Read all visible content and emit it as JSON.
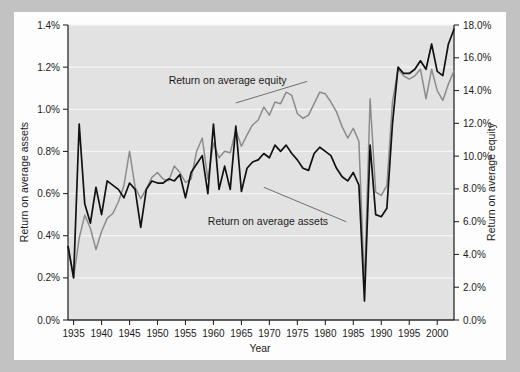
{
  "figure": {
    "background_color": "#fdfdfd",
    "plot_background_color": "#e2e2e2",
    "page_border_color": "#c2c2c2"
  },
  "chart_data": {
    "type": "line",
    "title": "",
    "subtitle": "",
    "xlabel": "Year",
    "ylabel": "Return on average assets",
    "y2label": "Return on average equity",
    "grid": true,
    "grid_color": "#f5f5f5",
    "legend_position": "inline-annotations",
    "xlim": [
      1934,
      2003
    ],
    "ylim": [
      0.0,
      1.4
    ],
    "y2lim": [
      0.0,
      18.0
    ],
    "xticks": [
      1935,
      1940,
      1945,
      1950,
      1955,
      1960,
      1965,
      1970,
      1975,
      1980,
      1985,
      1990,
      1995,
      2000
    ],
    "xtick_labels": [
      "1935",
      "1940",
      "1945",
      "1950",
      "1955",
      "1960",
      "1965",
      "1970",
      "1975",
      "1980",
      "1985",
      "1990",
      "1995",
      "2000"
    ],
    "yticks": [
      0.0,
      0.2,
      0.4,
      0.6,
      0.8,
      1.0,
      1.2,
      1.4
    ],
    "ytick_labels": [
      "0.0%",
      "0.2%",
      "0.4%",
      "0.6%",
      "0.8%",
      "1.0%",
      "1.2%",
      "1.4%"
    ],
    "y2ticks": [
      0.0,
      2.0,
      4.0,
      6.0,
      8.0,
      10.0,
      12.0,
      14.0,
      16.0,
      18.0
    ],
    "y2tick_labels": [
      "0.0%",
      "2.0%",
      "4.0%",
      "6.0%",
      "8.0%",
      "10.0%",
      "12.0%",
      "14.0%",
      "16.0%",
      "18.0%"
    ],
    "annotations": [
      {
        "text": "Return on average equity",
        "x": 1952.0,
        "y": 1.118,
        "leader_to_x": 1964.0,
        "leader_to_y": 1.03
      },
      {
        "text": "Return on average assets",
        "x": 1959.0,
        "y": 0.452,
        "leader_to_x": 1969.0,
        "leader_to_y": 0.63
      }
    ],
    "x": [
      1934,
      1935,
      1936,
      1937,
      1938,
      1939,
      1940,
      1941,
      1942,
      1943,
      1944,
      1945,
      1946,
      1947,
      1948,
      1949,
      1950,
      1951,
      1952,
      1953,
      1954,
      1955,
      1956,
      1957,
      1958,
      1959,
      1960,
      1961,
      1962,
      1963,
      1964,
      1965,
      1966,
      1967,
      1968,
      1969,
      1970,
      1971,
      1972,
      1973,
      1974,
      1975,
      1976,
      1977,
      1978,
      1979,
      1980,
      1981,
      1982,
      1983,
      1984,
      1985,
      1986,
      1987,
      1988,
      1989,
      1990,
      1991,
      1992,
      1993,
      1994,
      1995,
      1996,
      1997,
      1998,
      1999,
      2000,
      2001,
      2002,
      2003
    ],
    "series": [
      {
        "name": "Return on average assets",
        "axis": "left",
        "color": "#111111",
        "unit": "%",
        "values": [
          0.35,
          0.2,
          0.93,
          0.55,
          0.46,
          0.63,
          0.5,
          0.66,
          0.64,
          0.62,
          0.58,
          0.65,
          0.62,
          0.44,
          0.62,
          0.66,
          0.65,
          0.65,
          0.67,
          0.66,
          0.69,
          0.58,
          0.7,
          0.74,
          0.78,
          0.6,
          0.93,
          0.62,
          0.73,
          0.62,
          0.92,
          0.61,
          0.72,
          0.75,
          0.76,
          0.79,
          0.77,
          0.83,
          0.8,
          0.83,
          0.79,
          0.76,
          0.72,
          0.71,
          0.79,
          0.82,
          0.8,
          0.78,
          0.72,
          0.68,
          0.66,
          0.7,
          0.64,
          0.09,
          0.83,
          0.5,
          0.49,
          0.53,
          0.93,
          1.2,
          1.17,
          1.17,
          1.19,
          1.23,
          1.19,
          1.31,
          1.18,
          1.16,
          1.31,
          1.38
        ]
      },
      {
        "name": "Return on average equity",
        "axis": "right",
        "color": "#8c8c8c",
        "unit": "%",
        "values": [
          4.6,
          2.6,
          5.0,
          6.4,
          5.6,
          4.3,
          5.4,
          6.2,
          6.5,
          7.2,
          8.2,
          10.3,
          8.1,
          7.4,
          8.0,
          8.7,
          9.0,
          8.6,
          8.5,
          9.4,
          9.0,
          8.4,
          8.6,
          10.3,
          11.1,
          8.6,
          10.8,
          9.9,
          10.3,
          10.2,
          11.6,
          10.6,
          11.3,
          11.9,
          12.2,
          13.0,
          12.5,
          13.3,
          13.2,
          13.9,
          13.7,
          12.6,
          12.3,
          12.5,
          13.2,
          13.9,
          13.8,
          13.3,
          12.7,
          11.8,
          11.1,
          11.7,
          10.9,
          2.0,
          13.5,
          7.8,
          7.6,
          8.2,
          13.3,
          15.3,
          14.9,
          14.7,
          14.9,
          15.3,
          13.5,
          15.3,
          14.0,
          13.4,
          14.4,
          15.2
        ]
      }
    ]
  }
}
